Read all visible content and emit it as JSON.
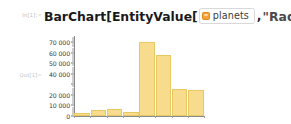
{
  "notebook": {
    "input_label": "In[1]:=",
    "output_label": "Out[1]=",
    "expression": {
      "prefix": "BarChart[EntityValue[",
      "entity_icon": "entity-class-icon",
      "entity_label": "planets",
      "comma": ",",
      "property": "\"Radius\"",
      "suffix": "]]"
    }
  },
  "colors": {
    "bar_fill": "#F7DC8E",
    "bar_edge": "#E8C864",
    "entity_icon": "#F4A236",
    "axis": "#8A8A8A",
    "label_gray": "#C2C2C2",
    "background": "#FFFFFF"
  },
  "chart_data": {
    "type": "bar",
    "title": "",
    "xlabel": "",
    "ylabel": "",
    "categories": [
      "1",
      "2",
      "3",
      "4",
      "5",
      "6",
      "7",
      "8"
    ],
    "values": [
      2440,
      6052,
      6371,
      3390,
      69911,
      58232,
      25362,
      24622
    ],
    "ylim": [
      0,
      74000
    ],
    "ytick_labels": [
      "0",
      "10 000",
      "20 000",
      "40 000",
      "50 000",
      "60 000",
      "70 000"
    ],
    "ytick_values": [
      0,
      10000,
      20000,
      40000,
      50000,
      60000,
      70000
    ],
    "ytick_all_values": [
      0,
      10000,
      20000,
      30000,
      40000,
      50000,
      60000,
      70000
    ],
    "yminor_step": 2000,
    "grid": false,
    "legend": null,
    "bar_color": "#F7DC8E"
  }
}
